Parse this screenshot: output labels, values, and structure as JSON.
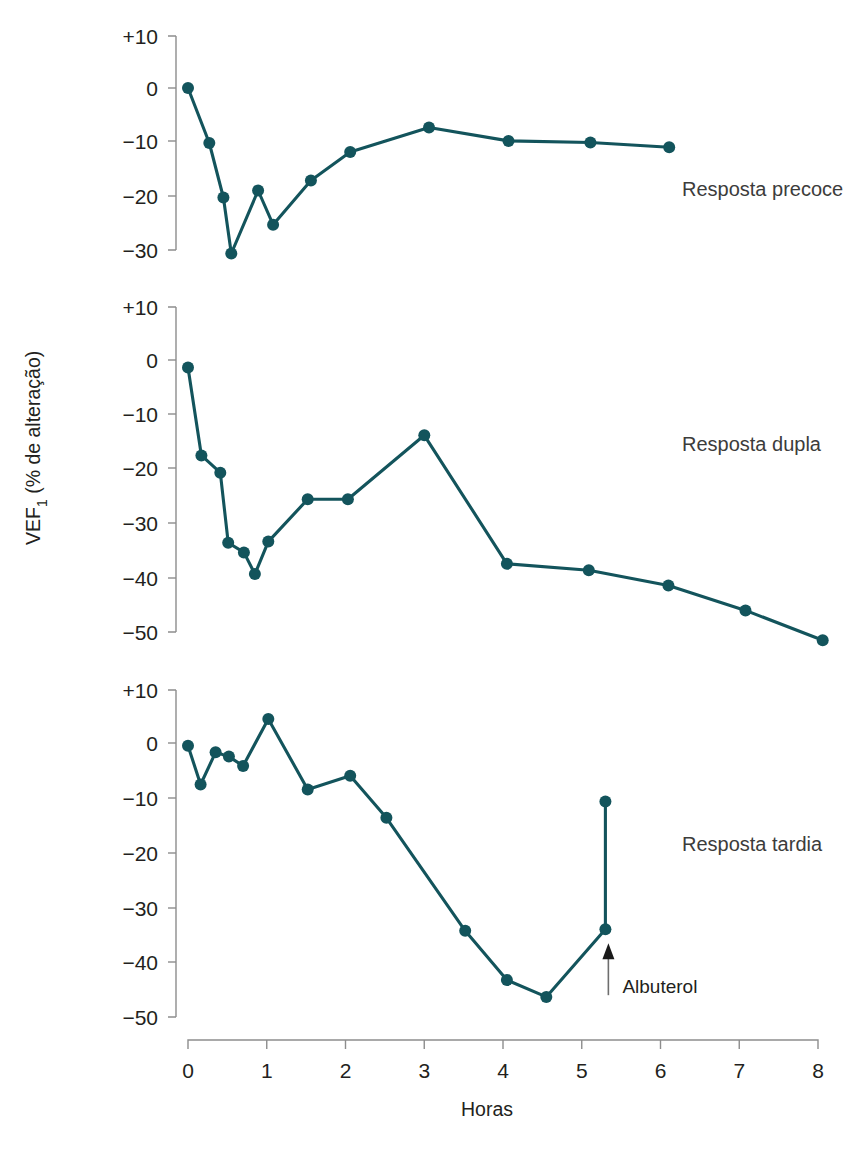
{
  "figure": {
    "title": "",
    "xlabel": "Horas",
    "ylabel_main": "VEF",
    "ylabel_sub": "1",
    "ylabel_rest": " (% de alteração)",
    "series_color": "#13545c",
    "axis_color": "#8d8d8d",
    "annotation": {
      "label": "Albuterol",
      "at_hour": 5.3
    }
  },
  "chart_data": [
    {
      "type": "line",
      "title": "Resposta precoce",
      "xlabel": "Horas",
      "ylabel": "VEF1 (% de alteração)",
      "xlim": [
        -0.25,
        8.4
      ],
      "ylim": [
        -33,
        11
      ],
      "yticks": [
        10,
        0,
        -10,
        -20,
        -30
      ],
      "ytick_labels": [
        "+10",
        "0",
        "−10",
        "−20",
        "−30"
      ],
      "grid": false,
      "legend": "none",
      "x": [
        0.0,
        0.27,
        0.45,
        0.55,
        0.89,
        1.08,
        1.56,
        2.06,
        3.06,
        4.07,
        5.11,
        6.11
      ],
      "y": [
        0.0,
        -10.3,
        -20.5,
        -31.0,
        -19.2,
        -25.6,
        -17.3,
        -12.0,
        -7.4,
        -9.9,
        -10.2,
        -11.1
      ]
    },
    {
      "type": "line",
      "title": "Resposta dupla",
      "xlabel": "Horas",
      "ylabel": "VEF1 (% de alteração)",
      "xlim": [
        -0.25,
        8.4
      ],
      "ylim": [
        -54,
        11
      ],
      "yticks": [
        10,
        0,
        -10,
        -20,
        -30,
        -40,
        -50
      ],
      "ytick_labels": [
        "+10",
        "0",
        "−10",
        "−20",
        "−30",
        "−40",
        "−50"
      ],
      "grid": false,
      "legend": "none",
      "x": [
        0.0,
        0.17,
        0.41,
        0.51,
        0.71,
        0.85,
        1.02,
        1.52,
        2.03,
        3.0,
        4.05,
        5.09,
        6.1,
        7.08,
        8.06
      ],
      "y": [
        -1.4,
        -17.6,
        -20.8,
        -33.7,
        -35.5,
        -39.5,
        -33.5,
        -25.7,
        -25.7,
        -13.9,
        -37.6,
        -38.8,
        -41.6,
        -46.2,
        -51.7
      ]
    },
    {
      "type": "line",
      "title": "Resposta tardia",
      "xlabel": "Horas",
      "ylabel": "VEF1 (% de alteração)",
      "xlim": [
        -0.25,
        8.4
      ],
      "ylim": [
        -52,
        11
      ],
      "yticks": [
        10,
        0,
        -10,
        -20,
        -30,
        -40,
        -50
      ],
      "ytick_labels": [
        "+10",
        "0",
        "−10",
        "−20",
        "−30",
        "−40",
        "−50"
      ],
      "grid": false,
      "legend": "none",
      "x": [
        0.0,
        0.16,
        0.35,
        0.52,
        0.7,
        1.02,
        1.52,
        2.06,
        2.52,
        3.52,
        4.05,
        4.55,
        5.3
      ],
      "y": [
        -0.5,
        -7.6,
        -1.7,
        -2.5,
        -4.2,
        4.4,
        -8.5,
        -6.0,
        -13.7,
        -34.4,
        -43.4,
        -46.5,
        -34.1
      ],
      "post_albuterol": {
        "x": 5.3,
        "y": -10.7
      }
    }
  ],
  "xaxis": {
    "ticks": [
      0,
      1,
      2,
      3,
      4,
      5,
      6,
      7,
      8
    ],
    "tick_labels": [
      "0",
      "1",
      "2",
      "3",
      "4",
      "5",
      "6",
      "7",
      "8"
    ],
    "label": "Horas"
  },
  "panels": [
    {
      "label": "Resposta precoce"
    },
    {
      "label": "Resposta dupla"
    },
    {
      "label": "Resposta tardia"
    }
  ]
}
